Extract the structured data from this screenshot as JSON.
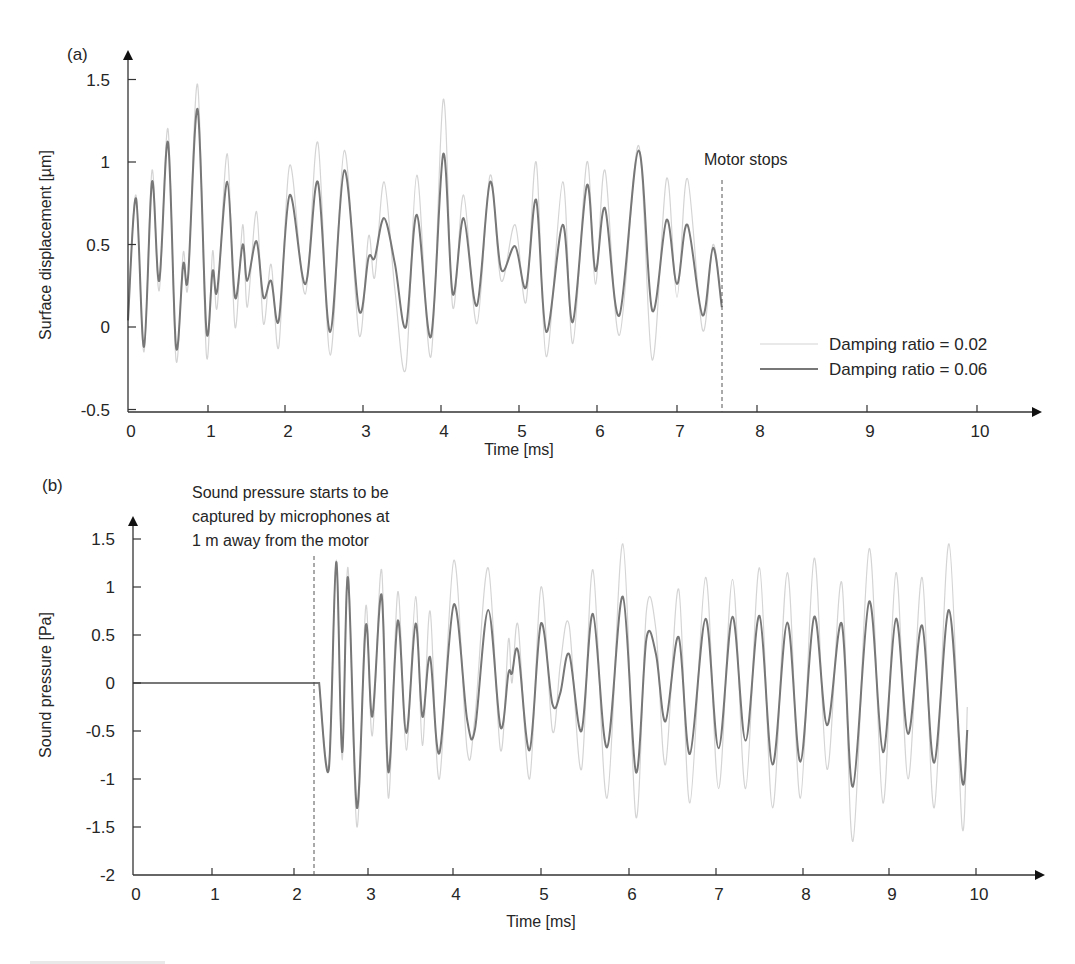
{
  "figure": {
    "panels": [
      {
        "id": "a",
        "panel_label": "(a)",
        "ylabel": "Surface displacement [µm]",
        "xlabel": "Time [ms]",
        "yticks": [
          "1.5",
          "1",
          "0.5",
          "0",
          "-0.5"
        ],
        "xticks": [
          "0",
          "1",
          "2",
          "3",
          "4",
          "5",
          "6",
          "7",
          "8",
          "9",
          "10"
        ],
        "annotation": "Motor stops",
        "legend": [
          {
            "label": "Damping ratio = 0.02",
            "color": "#d4d4d4"
          },
          {
            "label": "Damping ratio = 0.06",
            "color": "#767676"
          }
        ]
      },
      {
        "id": "b",
        "panel_label": "(b)",
        "ylabel": "Sound pressure [Pa]",
        "xlabel": "Time [ms]",
        "yticks": [
          "1.5",
          "1",
          "0.5",
          "0",
          "-0.5",
          "-1",
          "-1.5",
          "-2"
        ],
        "xticks": [
          "0",
          "1",
          "2",
          "3",
          "4",
          "5",
          "6",
          "7",
          "8",
          "9",
          "10"
        ],
        "annotation_lines": [
          "Sound pressure starts to be",
          "captured by microphones at",
          "1 m away from the motor"
        ]
      }
    ]
  },
  "chart_data": [
    {
      "type": "line",
      "title": "(a)",
      "xlabel": "Time [ms]",
      "ylabel": "Surface displacement [µm]",
      "xlim": [
        0,
        10
      ],
      "ylim": [
        -0.5,
        1.6
      ],
      "grid": false,
      "legend_position": "lower right",
      "annotations": [
        {
          "text": "Motor stops",
          "x": 7.55,
          "style": "dashed vertical line"
        }
      ],
      "series": [
        {
          "name": "Damping ratio = 0.06",
          "color": "#767676",
          "x": [
            0,
            0.1,
            0.2,
            0.3,
            0.39,
            0.5,
            0.6,
            0.69,
            0.75,
            0.87,
            0.98,
            1.06,
            1.12,
            1.25,
            1.35,
            1.45,
            1.51,
            1.63,
            1.72,
            1.82,
            1.92,
            2.06,
            2.26,
            2.42,
            2.58,
            2.76,
            2.95,
            3.07,
            3.15,
            3.27,
            3.41,
            3.55,
            3.69,
            3.87,
            4.03,
            4.15,
            4.29,
            4.46,
            4.63,
            4.77,
            4.95,
            5.09,
            5.22,
            5.35,
            5.56,
            5.69,
            5.87,
            5.98,
            6.1,
            6.28,
            6.52,
            6.69,
            6.87,
            7.0,
            7.13,
            7.32,
            7.45,
            7.56
          ],
          "values": [
            0.04,
            0.78,
            -0.12,
            0.88,
            0.28,
            1.12,
            -0.12,
            0.38,
            0.3,
            1.32,
            -0.02,
            0.34,
            0.22,
            0.88,
            0.18,
            0.5,
            0.28,
            0.52,
            0.18,
            0.28,
            0.04,
            0.8,
            0.26,
            0.88,
            -0.03,
            0.95,
            0.1,
            0.42,
            0.42,
            0.66,
            0.38,
            0.0,
            0.68,
            -0.06,
            1.05,
            0.2,
            0.66,
            0.13,
            0.88,
            0.35,
            0.49,
            0.24,
            0.77,
            -0.03,
            0.62,
            0.03,
            0.86,
            0.34,
            0.72,
            0.07,
            1.07,
            0.1,
            0.65,
            0.26,
            0.62,
            0.07,
            0.48,
            0.12
          ]
        },
        {
          "name": "Damping ratio = 0.02",
          "color": "#d4d4d4",
          "x": [
            0,
            0.1,
            0.2,
            0.3,
            0.39,
            0.5,
            0.6,
            0.69,
            0.75,
            0.87,
            0.98,
            1.06,
            1.12,
            1.25,
            1.35,
            1.45,
            1.51,
            1.63,
            1.72,
            1.82,
            1.92,
            2.06,
            2.26,
            2.42,
            2.58,
            2.76,
            2.95,
            3.07,
            3.15,
            3.27,
            3.41,
            3.55,
            3.69,
            3.87,
            4.03,
            4.15,
            4.29,
            4.46,
            4.63,
            4.77,
            4.95,
            5.09,
            5.22,
            5.35,
            5.56,
            5.69,
            5.87,
            5.98,
            6.1,
            6.28,
            6.52,
            6.69,
            6.87,
            7.0,
            7.13,
            7.32,
            7.45,
            7.56
          ],
          "values": [
            0.04,
            0.8,
            -0.15,
            0.95,
            0.22,
            1.2,
            -0.2,
            0.45,
            0.25,
            1.47,
            -0.17,
            0.46,
            0.12,
            1.05,
            0.0,
            0.62,
            0.12,
            0.7,
            0.02,
            0.38,
            -0.12,
            0.98,
            0.2,
            1.12,
            -0.17,
            1.07,
            -0.05,
            0.55,
            0.3,
            0.88,
            0.22,
            -0.25,
            0.92,
            -0.18,
            1.38,
            0.12,
            0.8,
            0.02,
            0.92,
            0.28,
            0.62,
            0.15,
            1.0,
            -0.18,
            0.88,
            -0.1,
            1.0,
            0.26,
            0.95,
            -0.05,
            1.1,
            -0.2,
            0.9,
            0.18,
            0.9,
            -0.02,
            0.5,
            0.12
          ]
        }
      ]
    },
    {
      "type": "line",
      "title": "(b)",
      "xlabel": "Time [ms]",
      "ylabel": "Sound pressure [Pa]",
      "xlim": [
        0,
        10
      ],
      "ylim": [
        -2,
        1.7
      ],
      "grid": false,
      "annotations": [
        {
          "text": "Sound pressure starts to be captured by microphones at 1 m away from the motor",
          "x": 2.27,
          "style": "dashed vertical line"
        }
      ],
      "series": [
        {
          "name": "Damping ratio = 0.06",
          "color": "#767676",
          "x": [
            0,
            2.34,
            2.47,
            2.57,
            2.65,
            2.73,
            2.85,
            2.97,
            3.05,
            3.16,
            3.24,
            3.35,
            3.45,
            3.56,
            3.64,
            3.73,
            3.84,
            4.01,
            4.16,
            4.25,
            4.4,
            4.54,
            4.63,
            4.67,
            4.74,
            4.87,
            5.0,
            5.13,
            5.22,
            5.32,
            5.46,
            5.59,
            5.75,
            5.93,
            6.08,
            6.2,
            6.31,
            6.42,
            6.57,
            6.7,
            6.88,
            7.03,
            7.19,
            7.34,
            7.5,
            7.65,
            7.82,
            7.97,
            8.13,
            8.28,
            8.45,
            8.58,
            8.77,
            8.93,
            9.08,
            9.22,
            9.38,
            9.52,
            9.69,
            9.84,
            9.9
          ],
          "values": [
            0,
            0,
            -0.9,
            1.26,
            -0.72,
            1.1,
            -1.3,
            0.6,
            -0.35,
            0.92,
            -0.93,
            0.65,
            -0.52,
            0.62,
            -0.35,
            0.27,
            -0.73,
            0.82,
            -0.38,
            -0.48,
            0.76,
            -0.46,
            0.1,
            0.1,
            0.33,
            -0.7,
            0.62,
            -0.22,
            -0.1,
            0.3,
            -0.5,
            0.72,
            -0.67,
            0.9,
            -0.93,
            0.46,
            0.3,
            -0.4,
            0.48,
            -0.74,
            0.67,
            -0.68,
            0.69,
            -0.6,
            0.7,
            -0.85,
            0.63,
            -0.82,
            0.69,
            -0.44,
            0.62,
            -1.08,
            0.85,
            -0.72,
            0.67,
            -0.53,
            0.6,
            -0.83,
            0.76,
            -1.02,
            -0.49
          ]
        },
        {
          "name": "Damping ratio = 0.02",
          "color": "#d4d4d4",
          "x": [
            0,
            2.34,
            2.47,
            2.57,
            2.65,
            2.73,
            2.85,
            2.97,
            3.05,
            3.16,
            3.24,
            3.35,
            3.45,
            3.56,
            3.64,
            3.73,
            3.84,
            4.01,
            4.16,
            4.25,
            4.4,
            4.54,
            4.63,
            4.67,
            4.74,
            4.87,
            5.0,
            5.13,
            5.22,
            5.32,
            5.46,
            5.59,
            5.75,
            5.93,
            6.08,
            6.2,
            6.31,
            6.42,
            6.57,
            6.7,
            6.88,
            7.03,
            7.19,
            7.34,
            7.5,
            7.65,
            7.82,
            7.97,
            8.13,
            8.28,
            8.45,
            8.58,
            8.77,
            8.93,
            9.08,
            9.22,
            9.38,
            9.52,
            9.69,
            9.84,
            9.9
          ],
          "values": [
            0,
            0,
            -0.85,
            1.28,
            -0.8,
            1.2,
            -1.5,
            0.8,
            -0.55,
            1.18,
            -1.2,
            0.95,
            -0.7,
            0.9,
            -0.65,
            0.75,
            -1.0,
            1.28,
            -0.7,
            -0.35,
            1.2,
            -0.7,
            0.45,
            0.0,
            0.6,
            -1.0,
            1.0,
            -0.5,
            0.2,
            0.6,
            -0.9,
            1.18,
            -1.2,
            1.45,
            -1.4,
            0.75,
            0.55,
            -0.85,
            0.98,
            -1.25,
            1.1,
            -1.1,
            1.08,
            -1.1,
            1.2,
            -1.3,
            1.15,
            -1.2,
            1.3,
            -0.9,
            1.05,
            -1.65,
            1.4,
            -1.25,
            1.15,
            -1.0,
            1.1,
            -1.3,
            1.45,
            -1.5,
            -0.25
          ]
        }
      ]
    }
  ]
}
